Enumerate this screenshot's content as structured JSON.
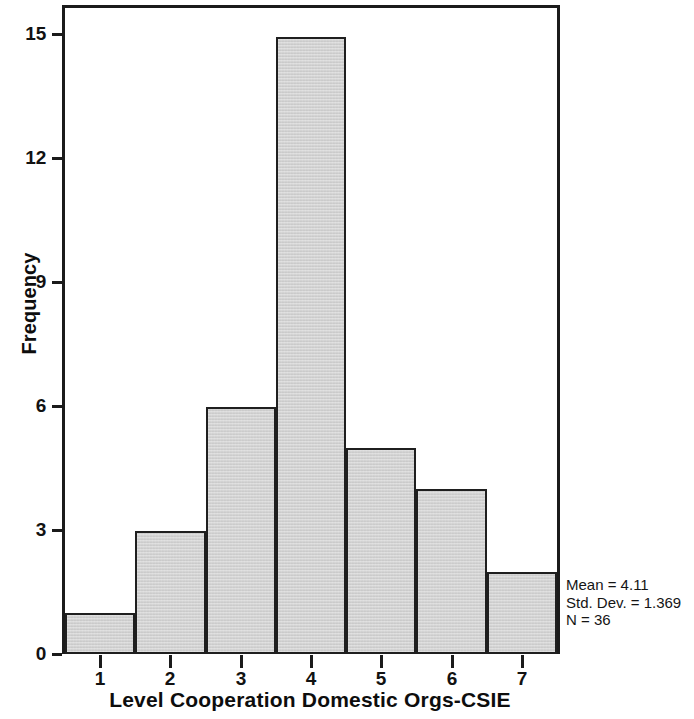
{
  "chart_data": {
    "type": "bar",
    "chart_subtype": "histogram",
    "title": "",
    "xlabel": "Level Cooperation Domestic Orgs-CSIE",
    "ylabel": "Frequency",
    "categories": [
      "1",
      "2",
      "3",
      "4",
      "5",
      "6",
      "7"
    ],
    "values": [
      1,
      3,
      6,
      15,
      5,
      4,
      2
    ],
    "x_tick_labels": [
      "1",
      "2",
      "3",
      "4",
      "5",
      "6",
      "7"
    ],
    "y_tick_labels": [
      "0",
      "3",
      "6",
      "9",
      "12",
      "15"
    ],
    "y_tick_values": [
      0,
      3,
      6,
      9,
      12,
      15
    ],
    "ylim": [
      0,
      15.7
    ],
    "xlim": [
      0.5,
      7.5
    ],
    "grid": false,
    "legend": "none",
    "bar_fill_color": "#cecece",
    "bar_edge_color": "#1f1f1f",
    "frame_color": "#1b1b1b",
    "background_color": "#ffffff",
    "annotations": {
      "mean_label": "Mean = 4.11",
      "std_dev_label": "Std. Dev. = 1.369",
      "n_label": "N = 36",
      "mean": 4.11,
      "std_dev": 1.369,
      "n": 36
    }
  }
}
